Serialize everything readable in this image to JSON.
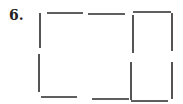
{
  "problem": {
    "number_label": "6."
  },
  "diagram": {
    "type": "matchstick-puzzle",
    "stroke_color": "#2a2a2a",
    "matchsticks": [
      {
        "id": "top-left",
        "x1": 47,
        "y1": 13,
        "x2": 83,
        "y2": 13
      },
      {
        "id": "top-middle",
        "x1": 88,
        "y1": 14,
        "x2": 125,
        "y2": 14
      },
      {
        "id": "top-right",
        "x1": 133,
        "y1": 12,
        "x2": 171,
        "y2": 12
      },
      {
        "id": "left-upper",
        "x1": 40,
        "y1": 13,
        "x2": 40,
        "y2": 48
      },
      {
        "id": "left-lower",
        "x1": 39,
        "y1": 54,
        "x2": 39,
        "y2": 92
      },
      {
        "id": "middle-upper",
        "x1": 133,
        "y1": 15,
        "x2": 133,
        "y2": 53
      },
      {
        "id": "middle-lower",
        "x1": 131,
        "y1": 62,
        "x2": 131,
        "y2": 100
      },
      {
        "id": "right-upper",
        "x1": 172,
        "y1": 13,
        "x2": 172,
        "y2": 51
      },
      {
        "id": "right-lower",
        "x1": 172,
        "y1": 62,
        "x2": 172,
        "y2": 99
      },
      {
        "id": "bottom-left",
        "x1": 41,
        "y1": 97,
        "x2": 77,
        "y2": 97
      },
      {
        "id": "bottom-middle",
        "x1": 92,
        "y1": 99,
        "x2": 129,
        "y2": 99
      },
      {
        "id": "bottom-right",
        "x1": 131,
        "y1": 101,
        "x2": 168,
        "y2": 101
      }
    ]
  }
}
